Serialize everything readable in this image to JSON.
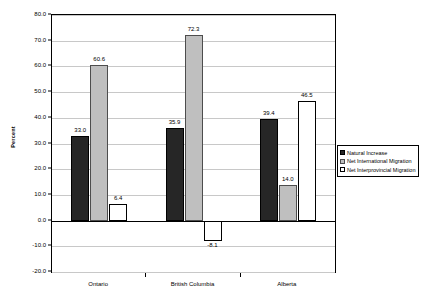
{
  "chart_data": {
    "type": "bar",
    "title": "",
    "xlabel": "",
    "ylabel": "Percent",
    "ylim": [
      -20.0,
      80.0
    ],
    "ytick_step": 10.0,
    "yticks": [
      "80.0",
      "70.0",
      "60.0",
      "50.0",
      "40.0",
      "30.0",
      "20.0",
      "10.0",
      "0.0",
      "-10.0",
      "-20.0"
    ],
    "grid": true,
    "legend_position": "right",
    "categories": [
      "Ontario",
      "British Columbia",
      "Alberta"
    ],
    "series": [
      {
        "name": "Natural Increase",
        "color": "#262626",
        "values": [
          33.0,
          35.9,
          39.4
        ],
        "labels": [
          "33.0",
          "35.9",
          "39.4"
        ]
      },
      {
        "name": "Net International Migration",
        "color": "#bfbfbf",
        "values": [
          60.6,
          72.3,
          14.0
        ],
        "labels": [
          "60.6",
          "72.3",
          "14.0"
        ]
      },
      {
        "name": "Net Interprovincial Migration",
        "color": "#ffffff",
        "values": [
          6.4,
          -8.1,
          46.5
        ],
        "labels": [
          "6.4",
          "-8.1",
          "46.5"
        ]
      }
    ]
  },
  "legend": {
    "items": [
      {
        "label": "Natural Increase"
      },
      {
        "label": "Net International Migration"
      },
      {
        "label": "Net Interprovincial Migration"
      }
    ]
  }
}
